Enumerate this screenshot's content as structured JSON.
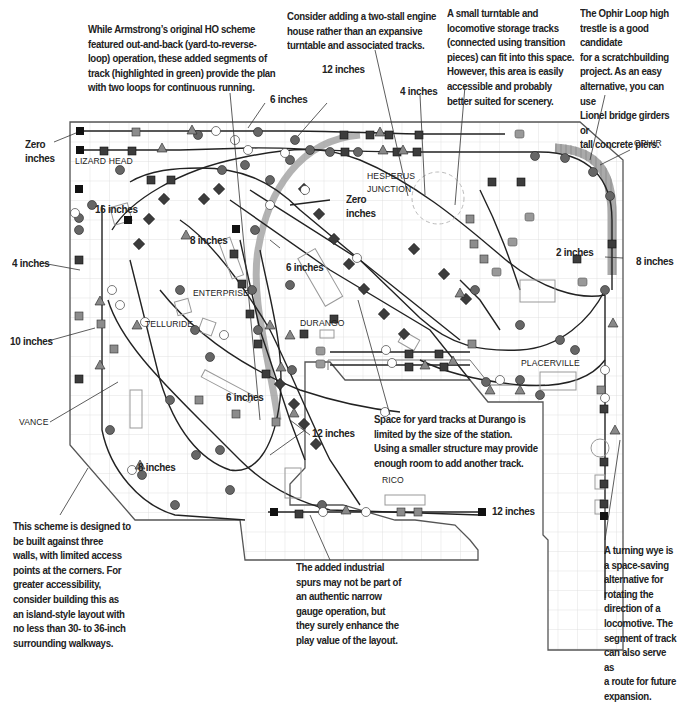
{
  "diagram": {
    "colors": {
      "track": "#222222",
      "green_track_highlight": "#8a8a8a",
      "grid": "#d9d9d9",
      "benchwork_outline": "#555555",
      "dark_node": "#3c3c3c",
      "mid_node": "#8c8c8c",
      "light_node": "#ffffff"
    },
    "towns": [
      {
        "id": "lizard-head",
        "label": "LIZARD HEAD"
      },
      {
        "id": "hesperus-junction",
        "label": "HESPERUS\nJUNCTION"
      },
      {
        "id": "ophir",
        "label": "OPHIR"
      },
      {
        "id": "enterprise",
        "label": "ENTERPRISE"
      },
      {
        "id": "telluride",
        "label": "TELLURIDE"
      },
      {
        "id": "durango",
        "label": "DURANGO"
      },
      {
        "id": "placerville",
        "label": "PLACERVILLE"
      },
      {
        "id": "vance",
        "label": "VANCE"
      },
      {
        "id": "rico",
        "label": "RICO"
      }
    ],
    "elevations": [
      {
        "id": "zero-inches-left",
        "label": "Zero\ninches"
      },
      {
        "id": "six-inches-top",
        "label": "6 inches"
      },
      {
        "id": "twelve-inches-top",
        "label": "12 inches"
      },
      {
        "id": "four-inches-top",
        "label": "4 inches"
      },
      {
        "id": "sixteen-inches",
        "label": "16 inches"
      },
      {
        "id": "eight-inches-mid",
        "label": "8 inches"
      },
      {
        "id": "zero-inches-mid",
        "label": "Zero\ninches"
      },
      {
        "id": "six-inches-mid",
        "label": "6 inches"
      },
      {
        "id": "two-inches",
        "label": "2 inches"
      },
      {
        "id": "eight-inches-right",
        "label": "8 inches"
      },
      {
        "id": "four-inches-left",
        "label": "4 inches"
      },
      {
        "id": "ten-inches",
        "label": "10 inches"
      },
      {
        "id": "six-inches-low",
        "label": "6 inches"
      },
      {
        "id": "twelve-inches-low",
        "label": "12 inches"
      },
      {
        "id": "eight-inches-low",
        "label": "8 inches"
      },
      {
        "id": "twelve-inches-bottom",
        "label": "12 inches"
      }
    ],
    "callouts": [
      {
        "id": "loops-note",
        "text": "While Armstrong’s original HO scheme\nfeatured out-and-back (yard-to-reverse-\nloop) operation, these added segments of\ntrack (highlighted in green) provide the plan\nwith two loops for continuous running."
      },
      {
        "id": "engine-house-note",
        "text": "Consider adding a two-stall engine\nhouse rather than an expansive\nturntable and associated tracks."
      },
      {
        "id": "turntable-note",
        "text": "A small turntable and\nlocomotive storage tracks\n(connected using transition\npieces) can fit into this space.\nHowever, this area is easily\naccessible and probably\nbetter suited for scenery."
      },
      {
        "id": "trestle-note",
        "text": "The Ophir Loop high\ntrestle is a good candidate\nfor a scratchbuilding\nproject. As an easy\nalternative, you can use\nLionel bridge girders or\ntall concrete piers."
      },
      {
        "id": "durango-yard-note",
        "text": "Space for yard tracks at Durango is\nlimited by the size of the station.\nUsing a smaller structure may provide\nenough room to add another track."
      },
      {
        "id": "walls-note",
        "text": "This scheme is designed to\nbe built against three\nwalls, with limited access\npoints at the corners. For\ngreater accessibility,\nconsider building this as\nan island-style layout with\nno less than 30- to 36-inch\nsurrounding walkways."
      },
      {
        "id": "industrial-spurs-note",
        "text": "The added industrial\nspurs may not be part of\nan authentic narrow\ngauge operation, but\nthey surely enhance the\nplay value of the layout."
      },
      {
        "id": "wye-note",
        "text": "A turning wye is\na space-saving\nalternative for\nrotating the\ndirection of a\nlocomotive. The\nsegment of track\ncan also serve as\na route for future\nexpansion."
      }
    ]
  }
}
